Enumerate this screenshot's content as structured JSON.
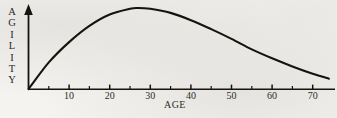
{
  "figure": {
    "background_color": "#f4f3f0",
    "ink_color": "#16140f",
    "y_axis_label_letters": [
      "A",
      "G",
      "I",
      "L",
      "I",
      "T",
      "Y"
    ],
    "y_axis_label": "AGILITY",
    "x_axis_title": "AGE"
  },
  "chart_data": {
    "type": "line",
    "title": "",
    "subtitle": "",
    "xlabel": "AGE",
    "ylabel": "AGILITY",
    "xlim": [
      0,
      75
    ],
    "ylim": [
      0,
      100
    ],
    "grid": false,
    "legend": null,
    "axis_style": {
      "y_axis_arrow": true,
      "x_axis_arrow": false,
      "y_tick_labels_shown": false,
      "minor_tick_interval": 5,
      "major_tick_interval": 10
    },
    "xticks_major": [
      10,
      20,
      30,
      40,
      50,
      60,
      70
    ],
    "xtick_labels": [
      "10",
      "20",
      "30",
      "40",
      "50",
      "60",
      "70"
    ],
    "xticks_minor": [
      5,
      15,
      25,
      35,
      45,
      55,
      65
    ],
    "annotations": [],
    "series": [
      {
        "name": "Agility",
        "x": [
          0,
          5,
          10,
          15,
          20,
          25,
          27,
          30,
          35,
          40,
          45,
          50,
          55,
          60,
          65,
          70,
          74
        ],
        "values": [
          0,
          33,
          58,
          78,
          92,
          99,
          100,
          99,
          94,
          85,
          74,
          62,
          49,
          38,
          28,
          19,
          13
        ]
      }
    ]
  }
}
